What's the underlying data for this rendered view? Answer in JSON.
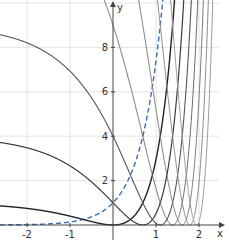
{
  "chart_data": {
    "type": "line",
    "title": "",
    "xlabel": "x",
    "ylabel": "y",
    "xlim": [
      -2.6,
      2.45
    ],
    "ylim": [
      0,
      10.1
    ],
    "grid": true,
    "legend": null,
    "x_ticks": [
      -2,
      -1,
      1,
      2
    ],
    "x_tick_labels": [
      "-2",
      "-1",
      "1",
      "2"
    ],
    "y_ticks": [
      2,
      4,
      6,
      8
    ],
    "y_tick_labels": [
      "2",
      "4",
      "6",
      "8"
    ],
    "series": [
      {
        "name": "y = e^(2x)",
        "k": 0,
        "style": "dashed",
        "color": "#3a6fb0",
        "width": 1.4
      },
      {
        "name": "y = (e^x - 1)^2",
        "k": 1,
        "style": "solid",
        "color": "#222222",
        "width": 1.4
      },
      {
        "name": "y = (e^x - 2)^2",
        "k": 2,
        "style": "solid",
        "color": "#3a3a3a",
        "width": 1.2
      },
      {
        "name": "y = (e^x - 3)^2",
        "k": 3,
        "style": "solid",
        "color": "#555555",
        "width": 1.1
      },
      {
        "name": "y = (e^x - 4)^2",
        "k": 4,
        "style": "solid",
        "color": "#6a6a6a",
        "width": 1.0
      },
      {
        "name": "y = (e^x - 5)^2",
        "k": 5,
        "style": "solid",
        "color": "#7c7c7c",
        "width": 1.0
      },
      {
        "name": "y = (e^x - 6)^2",
        "k": 6,
        "style": "solid",
        "color": "#8c8c8c",
        "width": 1.0
      },
      {
        "name": "y = (e^x - 7)^2",
        "k": 7,
        "style": "solid",
        "color": "#9a9a9a",
        "width": 1.0
      }
    ],
    "annotations": {
      "zeros_x": [
        0,
        0.69,
        1.1,
        1.39,
        1.61,
        1.79,
        1.95
      ],
      "y_intercepts": {
        "k1": 0,
        "k2": 1,
        "k3": 4,
        "k4": 9,
        "dashed": 1
      }
    }
  },
  "axes": {
    "x_label": "x",
    "y_label": "y",
    "x_ticks": [
      {
        "value": -2,
        "label": "-2"
      },
      {
        "value": -1,
        "label": "-1"
      },
      {
        "value": 1,
        "label": "1"
      },
      {
        "value": 2,
        "label": "2"
      }
    ],
    "y_ticks": [
      {
        "value": 2,
        "label": "2"
      },
      {
        "value": 4,
        "label": "4"
      },
      {
        "value": 6,
        "label": "6"
      },
      {
        "value": 8,
        "label": "8"
      }
    ]
  },
  "layout": {
    "origin_px": [
      113,
      225
    ],
    "x_unit_px": 43,
    "y_unit_px": 22.2,
    "grid_color": "#dddddd",
    "axis_color": "#444444"
  }
}
